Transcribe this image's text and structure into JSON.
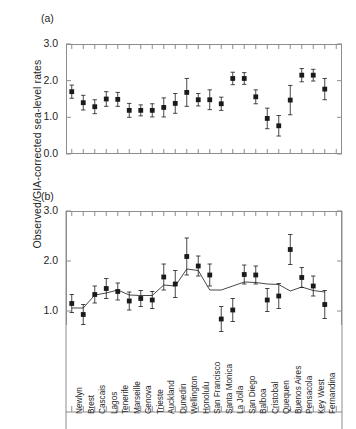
{
  "figure": {
    "ylabel": "Observed/GIA-corrected sea-level rates",
    "panel_a_tag": "(a)",
    "panel_b_tag": "(b)"
  },
  "chart_data": [
    {
      "type": "scatter",
      "panel": "(a)",
      "title": "",
      "xlabel": "",
      "ylabel": "Observed/GIA-corrected sea-level rates",
      "ylim": [
        0.0,
        3.0
      ],
      "yticks": [
        0.0,
        1.0,
        2.0,
        3.0
      ],
      "ytick_labels": [
        "0.0",
        "1.0",
        "2.0",
        "3.0"
      ],
      "grid": false,
      "legend": "none",
      "error_bars": true,
      "connecting_line": false,
      "categories": [
        "Newlyn",
        "Brest",
        "Cascais",
        "Lagos",
        "Tenerife",
        "Marseille",
        "Genova",
        "Trieste",
        "Auckland",
        "Dunedin",
        "Wellington",
        "Honolulu",
        "San Francisco",
        "Santa Monica",
        "La Jolla",
        "San Diego",
        "Balboa",
        "Cristobal",
        "Quequen",
        "Buenos Aires",
        "Pensacola",
        "Key West",
        "Fernandina",
        "Fernandina2"
      ],
      "values": [
        1.7,
        1.4,
        1.29,
        1.5,
        1.49,
        1.19,
        1.19,
        1.19,
        1.27,
        1.38,
        1.68,
        1.48,
        1.48,
        1.37,
        2.06,
        2.06,
        1.56,
        0.97,
        0.77,
        1.47,
        2.15,
        2.15,
        1.77,
        null
      ],
      "err_low": [
        0.18,
        0.2,
        0.19,
        0.2,
        0.19,
        0.19,
        0.15,
        0.18,
        0.26,
        0.27,
        0.38,
        0.17,
        0.27,
        0.18,
        0.17,
        0.16,
        0.19,
        0.28,
        0.28,
        0.4,
        0.18,
        0.16,
        0.29,
        null
      ],
      "err_high": [
        0.18,
        0.2,
        0.19,
        0.2,
        0.19,
        0.19,
        0.15,
        0.18,
        0.26,
        0.27,
        0.38,
        0.17,
        0.27,
        0.18,
        0.17,
        0.16,
        0.19,
        0.28,
        0.28,
        0.4,
        0.18,
        0.16,
        0.29,
        null
      ]
    },
    {
      "type": "line",
      "panel": "(b)",
      "title": "",
      "xlabel": "",
      "ylabel": "Observed/GIA-corrected sea-level rates",
      "ylim": [
        0.72,
        3.0
      ],
      "yticks": [
        1.0,
        2.0,
        3.0
      ],
      "ytick_labels": [
        "1.0",
        "2.0",
        "3.0"
      ],
      "grid": false,
      "legend": "none",
      "error_bars": true,
      "connecting_line": true,
      "categories": [
        "Newlyn",
        "Brest",
        "Cascais",
        "Lagos",
        "Tenerife",
        "Marseille",
        "Genova",
        "Trieste",
        "Auckland",
        "Dunedin",
        "Wellington",
        "Honolulu",
        "San Francisco",
        "Santa Monica",
        "La Jolla",
        "San Diego",
        "Balboa",
        "Cristobal",
        "Quequen",
        "Buenos Aires",
        "Pensacola",
        "Key West",
        "Fernandina"
      ],
      "values": [
        1.15,
        0.93,
        1.33,
        1.45,
        1.39,
        1.2,
        1.25,
        1.22,
        1.68,
        1.54,
        2.09,
        1.9,
        1.72,
        0.84,
        1.02,
        1.73,
        1.72,
        1.22,
        1.3,
        2.23,
        1.67,
        1.5,
        1.13
      ],
      "err_low": [
        0.18,
        0.2,
        0.17,
        0.2,
        0.17,
        0.18,
        0.16,
        0.17,
        0.26,
        0.27,
        0.37,
        0.2,
        0.22,
        0.25,
        0.23,
        0.19,
        0.18,
        0.23,
        0.25,
        0.3,
        0.2,
        0.2,
        0.28
      ],
      "err_high": [
        0.18,
        0.2,
        0.17,
        0.2,
        0.17,
        0.18,
        0.16,
        0.17,
        0.26,
        0.27,
        0.37,
        0.2,
        0.22,
        0.25,
        0.23,
        0.19,
        0.18,
        0.23,
        0.25,
        0.3,
        0.2,
        0.2,
        0.28
      ],
      "line_values": [
        1.06,
        1.06,
        1.32,
        1.36,
        1.42,
        1.32,
        1.31,
        1.31,
        1.52,
        1.5,
        1.84,
        1.81,
        1.42,
        1.42,
        1.5,
        1.58,
        1.57,
        1.54,
        1.53,
        1.4,
        1.48,
        1.41,
        1.38
      ]
    }
  ]
}
